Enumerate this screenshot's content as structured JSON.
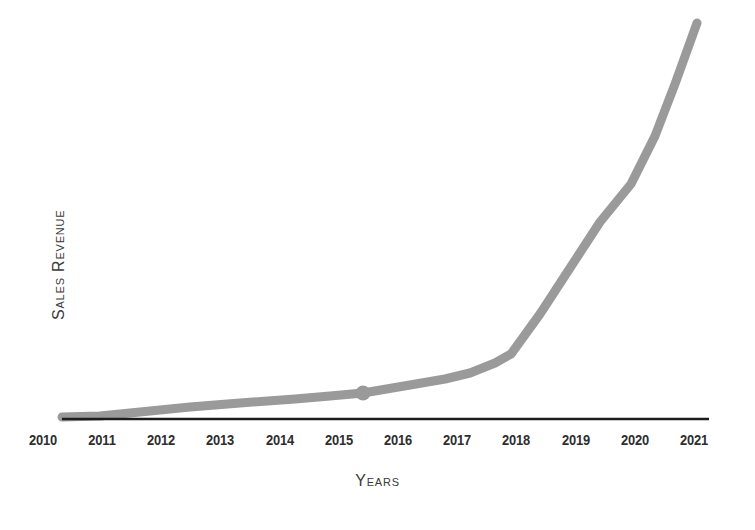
{
  "chart_data": {
    "type": "line",
    "title": "",
    "xlabel": "Years",
    "ylabel": "Sales Revenue",
    "grid": false,
    "legend": false,
    "x": [
      2010,
      2011,
      2012,
      2013,
      2014,
      2015,
      2016,
      2017,
      2018,
      2019,
      2020,
      2021
    ],
    "categories": [
      "2010",
      "2011",
      "2012",
      "2013",
      "2014",
      "2015",
      "2016",
      "2017",
      "2018",
      "2019",
      "2020",
      "2021"
    ],
    "series": [
      {
        "name": "Sales Revenue",
        "values": [
          2,
          6,
          13,
          20,
          26,
          33,
          42,
          54,
          78,
          122,
          165,
          258
        ],
        "color": "#9a9a9a",
        "line_width": 9,
        "markers": [
          {
            "x": 2015,
            "value": 33,
            "label": ""
          }
        ]
      }
    ],
    "xlim": [
      2010,
      2021
    ],
    "ylim": [
      0,
      275
    ],
    "y_tick_labels": [],
    "x_tick_labels": [
      "2010",
      "2011",
      "2012",
      "2013",
      "2014",
      "2015",
      "2016",
      "2017",
      "2018",
      "2019",
      "2020",
      "2021"
    ],
    "axis_color": "#1c1c1c",
    "background_color": "#ffffff"
  },
  "axes": {
    "x_title": "Years",
    "y_title": "Sales Revenue"
  },
  "ticks": [
    {
      "label": "2010",
      "px": 43
    },
    {
      "label": "2011",
      "px": 102
    },
    {
      "label": "2012",
      "px": 161
    },
    {
      "label": "2013",
      "px": 220
    },
    {
      "label": "2014",
      "px": 280
    },
    {
      "label": "2015",
      "px": 339
    },
    {
      "label": "2016",
      "px": 398
    },
    {
      "label": "2017",
      "px": 457
    },
    {
      "label": "2018",
      "px": 516
    },
    {
      "label": "2019",
      "px": 576
    },
    {
      "label": "2020",
      "px": 635
    },
    {
      "label": "2021",
      "px": 694
    }
  ],
  "colors": {
    "line": "#9a9a9a",
    "marker": "#9a9a9a",
    "axis": "#1c1c1c",
    "text": "#2e2e2e",
    "background": "#ffffff"
  },
  "geometry": {
    "line_path": "M 62 417 L 100 416 L 140 412 L 190 407 L 240 403 L 295 399 L 330 396 L 363 393 L 410 385 L 445 379 L 470 373 L 495 363 L 511 354 L 540 314 L 570 268 L 600 222 L 631 184 L 655 136 L 675 84 L 697 23",
    "axis_line": {
      "x1": 62,
      "y1": 419,
      "x2": 709,
      "y2": 419
    },
    "marker": {
      "cx": 363,
      "cy": 393,
      "r": 7.5
    }
  }
}
